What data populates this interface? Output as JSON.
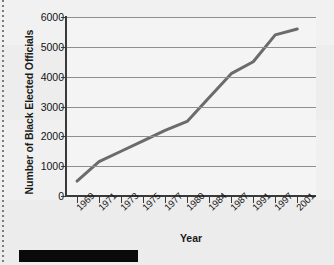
{
  "figure": {
    "background_color": "#efefef",
    "plot_background_color": "#f4f4f4",
    "caption_bar_color": "#0a0a0a"
  },
  "chart_data": {
    "type": "line",
    "title": "",
    "subtitle": "",
    "xlabel": "Year",
    "ylabel": "Number of Black Elected Officials",
    "categories": [
      "1969",
      "1971",
      "1973",
      "1975",
      "1977",
      "1980",
      "1984",
      "1987",
      "1991",
      "1997",
      "2001"
    ],
    "x": [
      "1969",
      "1971",
      "1973",
      "1975",
      "1977",
      "1980",
      "1984",
      "1987",
      "1991",
      "1997",
      "2001"
    ],
    "values": [
      500,
      1150,
      1500,
      1850,
      2200,
      2500,
      3300,
      4100,
      4500,
      5400,
      5600
    ],
    "series": [
      {
        "name": "Number of Black Elected Officials",
        "color": "#6b6b6b",
        "values": [
          500,
          1150,
          1500,
          1850,
          2200,
          2500,
          3300,
          4100,
          4500,
          5400,
          5600
        ]
      }
    ],
    "ylim": [
      0,
      6000
    ],
    "yticks": [
      0,
      1000,
      2000,
      3000,
      4000,
      5000,
      6000
    ],
    "ytick_labels": [
      "0",
      "1000",
      "2000",
      "3000",
      "4000",
      "5000",
      "6000"
    ],
    "grid": "horizontal",
    "legend": "none",
    "line_color": "#6b6b6b",
    "line_width": 3,
    "markers": "none",
    "annotations": []
  }
}
